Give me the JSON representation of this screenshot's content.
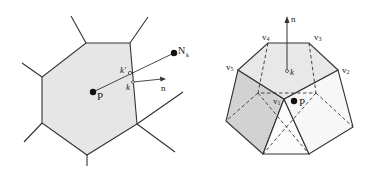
{
  "left_figure": {
    "description": "2D Voronoi cell around point P with neighbour N_k, face point k, its projection k', and face normal n",
    "labels": {
      "P": "P",
      "N": "N",
      "N_sub": "k",
      "k_prime": "k′",
      "k": "k",
      "n": "n"
    }
  },
  "right_figure": {
    "description": "3D polyhedral cell with top pentagonal face v1..v5, centroid k, normal n and point P",
    "labels": {
      "n": "n",
      "v1": "v",
      "v1_sub": "1",
      "v2": "v",
      "v2_sub": "2",
      "v3": "v",
      "v3_sub": "3",
      "v4": "v",
      "v4_sub": "4",
      "v5": "v",
      "v5_sub": "5",
      "k": "k",
      "P": "P"
    }
  },
  "colors": {
    "cell_fill": "#e6e6e6",
    "dark_face": "#d2d2d2",
    "mid_face": "#ececec",
    "light_face": "#fafafa",
    "stroke": "#333333"
  }
}
